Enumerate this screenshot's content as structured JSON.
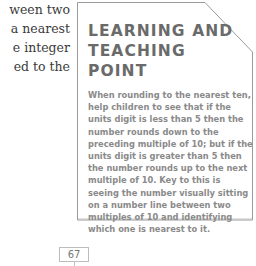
{
  "body_text": {
    "lines": [
      "ween two",
      "a nearest",
      "e integer",
      "ed to the"
    ]
  },
  "learning_box": {
    "title_lines": [
      "LEARNING AND",
      "TEACHING POINT"
    ],
    "body_lines": [
      "When rounding to the nearest ten,",
      "help children to see that if the",
      "units digit is less than 5 then the",
      "number rounds down to the",
      "preceding multiple of 10; but if the",
      "units digit is greater than 5 then",
      "the number rounds up to the next",
      "multiple of 10. Key to this is",
      "seeing the number visually sitting",
      "on a number line between two",
      "multiples of 10 and identifying",
      "which one is nearest to it."
    ],
    "colors": {
      "border": "#9a9a9a",
      "title": "#6a6a6a",
      "body": "#8a8a8a"
    }
  },
  "page_number": "67"
}
